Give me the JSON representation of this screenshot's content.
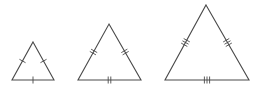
{
  "diagram": {
    "canvas": {
      "width": 257,
      "height": 94,
      "background": "#ffffff"
    },
    "stroke_color": "#4a4a4a",
    "triangles": [
      {
        "id": "small",
        "vertices": {
          "apex": [
            33,
            42
          ],
          "left": [
            12,
            80
          ],
          "right": [
            54,
            80
          ]
        },
        "tick_count": 1,
        "tick_length": 7,
        "tick_spacing": 2.6,
        "ticked_sides": [
          "left",
          "right",
          "base"
        ]
      },
      {
        "id": "medium",
        "vertices": {
          "apex": [
            109,
            24
          ],
          "left": [
            78,
            80
          ],
          "right": [
            141,
            80
          ]
        },
        "tick_count": 2,
        "tick_length": 7,
        "tick_spacing": 2.6,
        "ticked_sides": [
          "left",
          "right",
          "base"
        ]
      },
      {
        "id": "large",
        "vertices": {
          "apex": [
            206,
            5
          ],
          "left": [
            165,
            80
          ],
          "right": [
            249,
            80
          ]
        },
        "tick_count": 3,
        "tick_length": 7,
        "tick_spacing": 2.6,
        "ticked_sides": [
          "left",
          "right",
          "base"
        ]
      }
    ]
  }
}
